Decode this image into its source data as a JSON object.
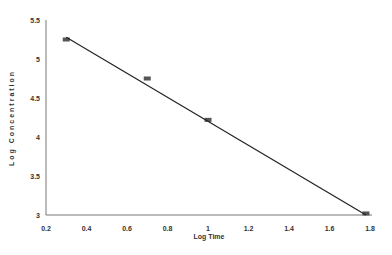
{
  "chart_data": {
    "type": "line",
    "title": "",
    "xlabel": "Log Time",
    "ylabel": "Log Concentration",
    "xlim": [
      0.2,
      1.8
    ],
    "ylim": [
      3,
      5.5
    ],
    "x_ticks": [
      "0.2",
      "0.4",
      "0.6",
      "0.8",
      "1",
      "1.2",
      "1.4",
      "1.6",
      "1.8"
    ],
    "y_ticks": [
      "3",
      "3.5",
      "4",
      "4.5",
      "5",
      "5.5"
    ],
    "grid": false,
    "legend": "none",
    "series": [
      {
        "name": "data",
        "type": "scatter",
        "x": [
          0.3,
          0.7,
          1.0,
          1.78
        ],
        "y": [
          5.25,
          4.75,
          4.22,
          3.02
        ]
      },
      {
        "name": "fit",
        "type": "line",
        "x": [
          0.3,
          1.78
        ],
        "y": [
          5.28,
          3.0
        ]
      }
    ]
  }
}
